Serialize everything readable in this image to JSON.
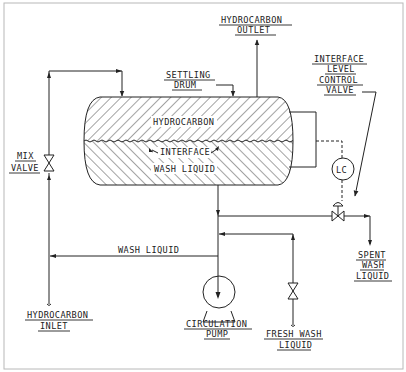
{
  "diagram": {
    "type": "process-flow-diagram",
    "colors": {
      "line": "#222222",
      "background": "#ffffff",
      "frame": "#b8b8b8"
    },
    "labels": {
      "hydrocarbon_outlet": [
        "HYDROCARBON",
        "OUTLET"
      ],
      "settling_drum": [
        "SETTLING",
        "DRUM"
      ],
      "interface_level_control_valve": [
        "INTERFACE",
        "LEVEL",
        "CONTROL",
        "VALVE"
      ],
      "hydrocarbon_layer": "HYDROCARBON",
      "interface": "INTERFACE",
      "wash_liquid_layer": "WASH LIQUID",
      "lc": "LC",
      "mix_valve": [
        "MIX",
        "VALVE"
      ],
      "wash_liquid_line": "WASH LIQUID",
      "spent_wash_liquid": [
        "SPENT",
        "WASH",
        "LIQUID"
      ],
      "hydrocarbon_inlet": [
        "HYDROCARBON",
        "INLET"
      ],
      "circulation_pump": [
        "CIRCULATION",
        "PUMP"
      ],
      "fresh_wash_liquid": [
        "FRESH WASH",
        "LIQUID"
      ]
    },
    "components": [
      {
        "id": "settling-drum",
        "kind": "horizontal vessel",
        "layers": [
          "HYDROCARBON",
          "WASH LIQUID"
        ]
      },
      {
        "id": "mix-valve",
        "kind": "gate valve"
      },
      {
        "id": "circulation-pump",
        "kind": "centrifugal pump"
      },
      {
        "id": "lc",
        "kind": "level controller"
      },
      {
        "id": "interface-level-control-valve",
        "kind": "control valve"
      },
      {
        "id": "fresh-wash-valve",
        "kind": "gate valve"
      }
    ],
    "streams": [
      {
        "from": "HYDROCARBON INLET",
        "to": "MIX VALVE"
      },
      {
        "from": "MIX VALVE",
        "to": "SETTLING DRUM"
      },
      {
        "from": "SETTLING DRUM",
        "to": "HYDROCARBON OUTLET"
      },
      {
        "from": "SETTLING DRUM",
        "to": "CIRCULATION PUMP"
      },
      {
        "from": "CIRCULATION PUMP",
        "to": "MIX VALVE",
        "label": "WASH LIQUID"
      },
      {
        "from": "FRESH WASH LIQUID",
        "to": "CIRCULATION PUMP"
      },
      {
        "from": "SETTLING DRUM",
        "to": "SPENT WASH LIQUID",
        "via": "INTERFACE LEVEL CONTROL VALVE"
      }
    ]
  }
}
